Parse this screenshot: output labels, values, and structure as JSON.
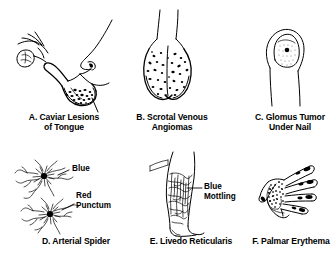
{
  "figure": {
    "background_color": "#ffffff",
    "ink_color": "#000000",
    "style": "black-and-white medical line illustration",
    "layout": "2 rows x 3 columns of labeled clinical drawings"
  },
  "panels": [
    {
      "id": "A",
      "key": "caviar-lesions-of-tongue",
      "caption_line1": "A. Caviar Lesions",
      "caption_line2": "of Tongue",
      "depicts": "profile of a face with fingers lifting the tongue tip, showing stippled caviar lesions on the ventral tongue surface"
    },
    {
      "id": "B",
      "key": "scrotal-venous-angiomas",
      "caption_line1": "B. Scrotal Venous",
      "caption_line2": "Angiomas",
      "depicts": "scrotum speckled with small dark venous angiomas"
    },
    {
      "id": "C",
      "key": "glomus-tumor-under-nail",
      "caption_line1": "C. Glomus Tumor",
      "caption_line2": "Under Nail",
      "depicts": "fingertip and nail plate with a small dark glomus tumor beneath the nail"
    },
    {
      "id": "D",
      "key": "arterial-spider",
      "caption_line1": "D. Arterial Spider",
      "caption_line2": "",
      "depicts": "two spider angiomas with radiating vessels from a central punctum"
    },
    {
      "id": "E",
      "key": "livedo-reticularis",
      "caption_line1": "E. Livedo Reticularis",
      "caption_line2": "",
      "depicts": "lower leg with net-like reticular mottling of the skin"
    },
    {
      "id": "F",
      "key": "palmar-erythema",
      "caption_line1": "F. Palmar Erythema",
      "caption_line2": "",
      "depicts": "open hand with shaded thenar, hypothenar and fingertip pads"
    }
  ],
  "annotations": [
    {
      "key": "blue",
      "text": "Blue",
      "panel": "D",
      "points_to": "radiating vessels of upper spider angioma"
    },
    {
      "key": "red-punctum-line1",
      "text": "Red",
      "panel": "D",
      "points_to": "central punctum of lower spider angioma"
    },
    {
      "key": "red-punctum-line2",
      "text": "Punctum",
      "panel": "D",
      "points_to": "central punctum of lower spider angioma"
    },
    {
      "key": "blue-mottling-line1",
      "text": "Blue",
      "panel": "E",
      "points_to": "reticular mottling on calf"
    },
    {
      "key": "blue-mottling-line2",
      "text": "Mottling",
      "panel": "E",
      "points_to": "reticular mottling on calf"
    }
  ]
}
